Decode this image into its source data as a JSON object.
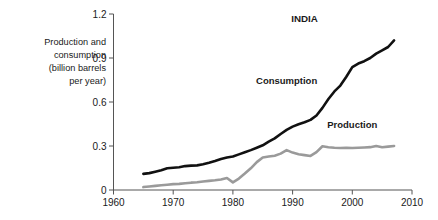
{
  "chart_data": {
    "type": "line",
    "title": "INDIA",
    "xlabel": "",
    "ylabel": "Production and consumption (billion barrels per year)",
    "ylabel_lines": [
      "Production and",
      "consumption",
      "(billion barrels",
      "per year)"
    ],
    "xlim": [
      1960,
      2010
    ],
    "ylim": [
      0,
      1.2
    ],
    "xticks": [
      1960,
      1970,
      1980,
      1990,
      2000,
      2010
    ],
    "xticklabels": [
      "1960",
      "1970",
      "1980",
      "1990",
      "2000",
      "2010"
    ],
    "yticks": [
      0,
      0.3,
      0.6,
      0.9,
      1.2
    ],
    "yticklabels": [
      "0",
      "0.3",
      "0.6",
      "0.9",
      "1.2"
    ],
    "grid": false,
    "legend_position": "inline-annotations",
    "series": [
      {
        "name": "Consumption",
        "color": "#111111",
        "label_x": 1989,
        "label_y": 0.72,
        "x": [
          1965,
          1966,
          1967,
          1968,
          1969,
          1970,
          1971,
          1972,
          1973,
          1974,
          1975,
          1976,
          1977,
          1978,
          1979,
          1980,
          1981,
          1982,
          1983,
          1984,
          1985,
          1986,
          1987,
          1988,
          1989,
          1990,
          1991,
          1992,
          1993,
          1994,
          1995,
          1996,
          1997,
          1998,
          1999,
          2000,
          2001,
          2002,
          2003,
          2004,
          2005,
          2006,
          2007
        ],
        "y": [
          0.11,
          0.115,
          0.125,
          0.135,
          0.148,
          0.152,
          0.155,
          0.163,
          0.166,
          0.168,
          0.175,
          0.186,
          0.198,
          0.212,
          0.222,
          0.228,
          0.243,
          0.258,
          0.272,
          0.288,
          0.305,
          0.33,
          0.352,
          0.382,
          0.41,
          0.432,
          0.448,
          0.462,
          0.478,
          0.508,
          0.56,
          0.62,
          0.672,
          0.712,
          0.772,
          0.838,
          0.862,
          0.878,
          0.9,
          0.93,
          0.952,
          0.975,
          1.02
        ]
      },
      {
        "name": "Production",
        "color": "#9a9a9a",
        "label_x": 2000,
        "label_y": 0.42,
        "x": [
          1965,
          1966,
          1967,
          1968,
          1969,
          1970,
          1971,
          1972,
          1973,
          1974,
          1975,
          1976,
          1977,
          1978,
          1979,
          1980,
          1981,
          1982,
          1983,
          1984,
          1985,
          1986,
          1987,
          1988,
          1989,
          1990,
          1991,
          1992,
          1993,
          1994,
          1995,
          1996,
          1997,
          1998,
          1999,
          2000,
          2001,
          2002,
          2003,
          2004,
          2005,
          2006,
          2007
        ],
        "y": [
          0.02,
          0.024,
          0.028,
          0.032,
          0.036,
          0.04,
          0.042,
          0.046,
          0.05,
          0.053,
          0.058,
          0.062,
          0.066,
          0.072,
          0.082,
          0.052,
          0.078,
          0.112,
          0.148,
          0.19,
          0.222,
          0.228,
          0.234,
          0.248,
          0.272,
          0.255,
          0.244,
          0.238,
          0.232,
          0.258,
          0.298,
          0.292,
          0.288,
          0.286,
          0.288,
          0.286,
          0.288,
          0.29,
          0.292,
          0.3,
          0.292,
          0.296,
          0.3
        ]
      }
    ]
  }
}
